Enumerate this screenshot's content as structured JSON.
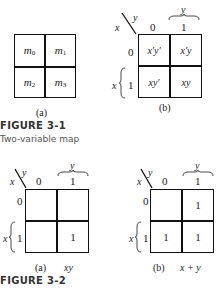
{
  "figure_3_1": {
    "label": "FIGURE 3-1",
    "caption": "Two-variable map",
    "map_a": {
      "sublabel": "(a)",
      "cells": [
        {
          "base": "m",
          "sub": "0"
        },
        {
          "base": "m",
          "sub": "1"
        },
        {
          "base": "m",
          "sub": "2"
        },
        {
          "base": "m",
          "sub": "3"
        }
      ]
    },
    "map_b": {
      "sublabel": "(b)",
      "row_var": "x",
      "col_var": "y",
      "col_headers": [
        "0",
        "1"
      ],
      "row_headers": [
        "0",
        "1"
      ],
      "col_brace_var": "y",
      "row_brace_var": "x",
      "cells": [
        "x'y'",
        "x'y",
        "xy'",
        "xy"
      ]
    }
  },
  "figure_3_2": {
    "label": "FIGURE 3-2",
    "map_a": {
      "sublabel": "(a)",
      "expr": "xy",
      "row_var": "x",
      "col_var": "y",
      "col_headers": [
        "0",
        "1"
      ],
      "row_headers": [
        "0",
        "1"
      ],
      "col_brace_var": "y",
      "row_brace_var": "x",
      "cells": [
        "",
        "",
        "",
        "1"
      ]
    },
    "map_b": {
      "sublabel": "(b)",
      "expr": "x + y",
      "row_var": "x",
      "col_var": "y",
      "col_headers": [
        "0",
        "1"
      ],
      "row_headers": [
        "0",
        "1"
      ],
      "col_brace_var": "y",
      "row_brace_var": "x",
      "cells": [
        "",
        "1",
        "1",
        "1"
      ]
    }
  }
}
